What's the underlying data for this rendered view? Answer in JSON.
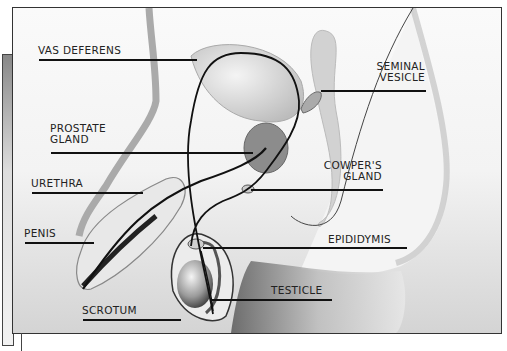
{
  "diagram": {
    "type": "anatomical illustration",
    "labels": [
      {
        "id": "vas-deferens",
        "text": "VAS DEFERENS"
      },
      {
        "id": "prostate-gland",
        "text": "PROSTATE\nGLAND"
      },
      {
        "id": "urethra",
        "text": "URETHRA"
      },
      {
        "id": "penis",
        "text": "PENIS"
      },
      {
        "id": "scrotum",
        "text": "SCROTUM"
      },
      {
        "id": "seminal-vesicle",
        "text": "SEMINAL\nVESICLE"
      },
      {
        "id": "cowpers-gland",
        "text": "COWPER'S\nGLAND"
      },
      {
        "id": "epididymis",
        "text": "EPIDIDYMIS"
      },
      {
        "id": "testicle",
        "text": "TESTICLE"
      }
    ],
    "colors": {
      "frame_border": "#333333",
      "leader_line": "#111111",
      "tissue_light": "#e0e0e0",
      "tissue_mid": "#a8a8a8",
      "tissue_dark": "#555555"
    }
  }
}
